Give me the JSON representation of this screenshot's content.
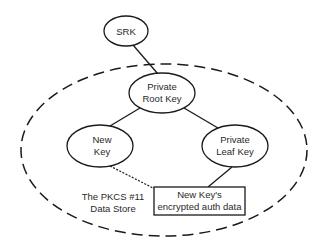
{
  "diagram": {
    "type": "key-hierarchy",
    "nodes": {
      "srk": {
        "lines": [
          "SRK"
        ]
      },
      "private_root_key": {
        "lines": [
          "Private",
          "Root Key"
        ]
      },
      "new_key": {
        "lines": [
          "New",
          "Key"
        ]
      },
      "private_leaf_key": {
        "lines": [
          "Private",
          "Leaf Key"
        ]
      },
      "auth_data_box": {
        "lines": [
          "New Key's",
          "encrypted auth data"
        ]
      }
    },
    "region_label": {
      "lines": [
        "The PKCS #11",
        "Data Store"
      ]
    },
    "edges": [
      {
        "from": "srk",
        "to": "private_root_key",
        "style": "solid"
      },
      {
        "from": "private_root_key",
        "to": "new_key",
        "style": "solid"
      },
      {
        "from": "private_root_key",
        "to": "private_leaf_key",
        "style": "solid"
      },
      {
        "from": "private_leaf_key",
        "to": "auth_data_box",
        "style": "solid"
      },
      {
        "from": "new_key",
        "to": "auth_data_box",
        "style": "dotted"
      }
    ],
    "colors": {
      "stroke": "#1a1a1a",
      "text": "#2a2a2a",
      "background": "#ffffff"
    }
  }
}
